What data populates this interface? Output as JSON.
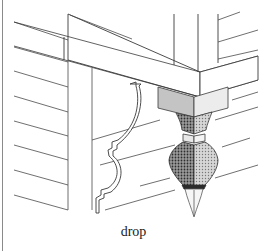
{
  "illustration": {
    "subject": "drop",
    "caption": "drop",
    "parts": [
      "clapboard-siding",
      "corner-board",
      "cornice-fascia",
      "scroll-bracket",
      "pendant-drop-finial"
    ],
    "colors": {
      "line": "#4a4a4a",
      "light_fill": "#e4e4e4",
      "mid_fill": "#c8c8c8",
      "dark_fill": "#5a5a5a",
      "background": "#ffffff"
    }
  }
}
